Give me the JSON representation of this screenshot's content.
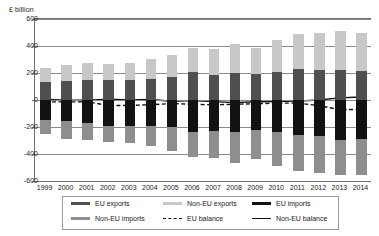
{
  "chart_data": {
    "type": "bar",
    "title": "",
    "subtitle": "",
    "xlabel": "",
    "ylabel": "£ billion",
    "ylim": [
      -600,
      600
    ],
    "yticks": [
      600,
      400,
      200,
      0,
      -200,
      -400,
      -600
    ],
    "ytick_labels": [
      "600",
      "400",
      "200",
      "0",
      "-200",
      "-400",
      "-600"
    ],
    "grid": true,
    "legend_position": "bottom",
    "stacked": true,
    "categories": [
      "1999",
      "2000",
      "2001",
      "2002",
      "2003",
      "2004",
      "2005",
      "2006",
      "2007",
      "2008",
      "2009",
      "2010",
      "2011",
      "2012",
      "2013",
      "2014"
    ],
    "series": [
      {
        "name": "EU exports",
        "type": "bar",
        "stack": "positive",
        "color": "#4f4f4f",
        "values": [
          132,
          140,
          150,
          145,
          147,
          157,
          173,
          205,
          188,
          203,
          190,
          211,
          233,
          223,
          222,
          218
        ]
      },
      {
        "name": "Non-EU exports",
        "type": "bar",
        "stack": "positive",
        "color": "#c8c8c8",
        "values": [
          104,
          122,
          126,
          122,
          127,
          144,
          162,
          177,
          187,
          209,
          196,
          234,
          254,
          270,
          286,
          281
        ]
      },
      {
        "name": "EU imports",
        "type": "bar",
        "stack": "negative",
        "color": "#121212",
        "values": [
          -150,
          -158,
          -167,
          -190,
          -191,
          -196,
          -203,
          -240,
          -228,
          -238,
          -222,
          -238,
          -260,
          -268,
          -297,
          -292
        ]
      },
      {
        "name": "Non-EU imports",
        "type": "bar",
        "stack": "negative",
        "color": "#8e8e8e",
        "values": [
          -104,
          -128,
          -131,
          -120,
          -130,
          -144,
          -175,
          -184,
          -203,
          -232,
          -213,
          -249,
          -266,
          -274,
          -262,
          -262
        ]
      },
      {
        "name": "EU balance",
        "type": "line",
        "style": "dashed",
        "color": "#111111",
        "values": [
          -18,
          -18,
          -17,
          -45,
          -44,
          -39,
          -30,
          -35,
          -40,
          -35,
          -32,
          -27,
          -27,
          -45,
          -75,
          -74
        ]
      },
      {
        "name": "Non-EU balance",
        "type": "line",
        "style": "solid",
        "color": "#111111",
        "values": [
          0,
          -6,
          -5,
          2,
          -3,
          0,
          -13,
          -7,
          -16,
          -23,
          -17,
          -15,
          -12,
          -4,
          12,
          19
        ]
      }
    ]
  },
  "legend": {
    "items": [
      {
        "label": "EU exports",
        "icon": "swatch-dark-gray",
        "style": "swatch"
      },
      {
        "label": "Non-EU exports",
        "icon": "swatch-light-gray",
        "style": "swatch"
      },
      {
        "label": "EU imports",
        "icon": "swatch-black",
        "style": "swatch"
      },
      {
        "label": "Non-EU imports",
        "icon": "swatch-mid-gray",
        "style": "swatch"
      },
      {
        "label": "EU balance",
        "icon": "dashed-line",
        "style": "dash"
      },
      {
        "label": "Non-EU balance",
        "icon": "solid-line",
        "style": "line"
      }
    ]
  },
  "colors": {
    "eu_exports": "#4f4f4f",
    "non_eu_exports": "#c8c8c8",
    "eu_imports": "#121212",
    "non_eu_imports": "#8e8e8e",
    "balance_line": "#111111",
    "gridline": "#8a8a8a",
    "axis": "#6e6e6e",
    "background": "#ffffff"
  }
}
